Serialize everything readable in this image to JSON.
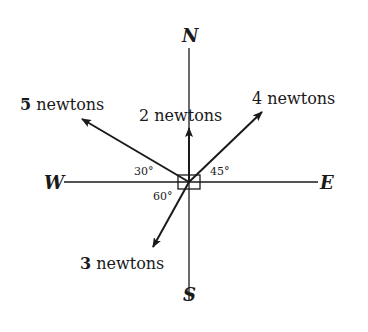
{
  "diagram": {
    "type": "force-vectors",
    "center": {
      "x": 189,
      "y": 182
    },
    "colors": {
      "ink": "#1a1a1a",
      "background": "#ffffff"
    },
    "directions": {
      "north": "N",
      "south": "S",
      "east": "E",
      "west": "W"
    },
    "forces": [
      {
        "id": "f5",
        "magnitude": "5",
        "unit": "newtons",
        "direction": "30° above west"
      },
      {
        "id": "f2",
        "magnitude": "2",
        "unit": "newtons",
        "direction": "north"
      },
      {
        "id": "f4",
        "magnitude": "4",
        "unit": "newtons",
        "direction": "45° above east"
      },
      {
        "id": "f3",
        "magnitude": "3",
        "unit": "newtons",
        "direction": "60° below west"
      }
    ],
    "angles": {
      "a30": "30°",
      "a45": "45°",
      "a60": "60°"
    }
  }
}
